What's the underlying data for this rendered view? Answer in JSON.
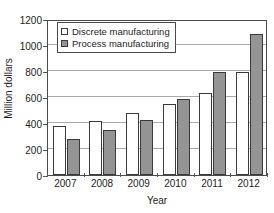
{
  "chart_data": {
    "type": "bar",
    "title": "",
    "xlabel": "Year",
    "ylabel": "Million dollars",
    "categories": [
      "2007",
      "2008",
      "2009",
      "2010",
      "2011",
      "2012"
    ],
    "series": [
      {
        "name": "Discrete manufacturing",
        "color": "#ffffff",
        "values": [
          380,
          415,
          480,
          550,
          630,
          790
        ]
      },
      {
        "name": "Process manufacturing",
        "color": "#949494",
        "values": [
          280,
          345,
          420,
          585,
          790,
          1085
        ]
      }
    ],
    "ylim": [
      0,
      1200
    ],
    "yticks": [
      0,
      200,
      400,
      600,
      800,
      1000,
      1200
    ],
    "ytick_labels": [
      "0",
      "200",
      "400",
      "600",
      "800",
      "1000",
      "1200"
    ],
    "grid": true,
    "grid_axis": "y",
    "legend_position": "upper-left-inside"
  },
  "axes": {
    "y_title": "Million dollars",
    "x_title": "Year"
  },
  "legend": {
    "entries": [
      {
        "label": "Discrete manufacturing",
        "swatch": "legend-swatch-discrete"
      },
      {
        "label": "Process manufacturing",
        "swatch": "legend-swatch-process"
      }
    ]
  }
}
